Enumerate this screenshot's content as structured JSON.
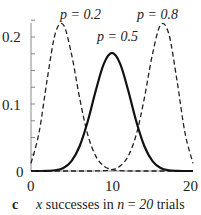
{
  "chart_data": {
    "type": "line",
    "title": "",
    "panel_label": "c",
    "xlabel": "x successes in n = 20 trials",
    "xlabel_parts": {
      "var": "x",
      "mid": " successes in ",
      "n": "n",
      "eq": " = ",
      "nval": "20",
      "end": "  trials"
    },
    "ylabel": "",
    "xlim": [
      0,
      20
    ],
    "ylim": [
      0,
      0.22
    ],
    "x_ticks": [
      "0",
      "10",
      "20"
    ],
    "y_ticks": [
      "0",
      "0.1",
      "0.2"
    ],
    "grid": false,
    "series": [
      {
        "name": "p = 0.2",
        "style": "dashed",
        "p": 0.2,
        "x": [
          0,
          1,
          2,
          3,
          4,
          5,
          6,
          7,
          8,
          9,
          10,
          11,
          12,
          13,
          14,
          15,
          16,
          17,
          18,
          19,
          20
        ],
        "values": [
          0.0115,
          0.0576,
          0.1369,
          0.2054,
          0.2182,
          0.1746,
          0.1091,
          0.0545,
          0.0222,
          0.0074,
          0.002,
          0.0005,
          0.0001,
          0,
          0,
          0,
          0,
          0,
          0,
          0,
          0
        ]
      },
      {
        "name": "p = 0.5",
        "style": "solid",
        "p": 0.5,
        "x": [
          0,
          1,
          2,
          3,
          4,
          5,
          6,
          7,
          8,
          9,
          10,
          11,
          12,
          13,
          14,
          15,
          16,
          17,
          18,
          19,
          20
        ],
        "values": [
          0,
          0,
          0.0002,
          0.0011,
          0.0046,
          0.0148,
          0.037,
          0.0739,
          0.1201,
          0.1602,
          0.1762,
          0.1602,
          0.1201,
          0.0739,
          0.037,
          0.0148,
          0.0046,
          0.0011,
          0.0002,
          0,
          0
        ]
      },
      {
        "name": "p = 0.8",
        "style": "dashed",
        "p": 0.8,
        "x": [
          0,
          1,
          2,
          3,
          4,
          5,
          6,
          7,
          8,
          9,
          10,
          11,
          12,
          13,
          14,
          15,
          16,
          17,
          18,
          19,
          20
        ],
        "values": [
          0,
          0,
          0,
          0,
          0,
          0,
          0,
          0,
          0.0001,
          0.0005,
          0.002,
          0.0074,
          0.0222,
          0.0545,
          0.1091,
          0.1746,
          0.2182,
          0.2054,
          0.1369,
          0.0576,
          0.0115
        ]
      }
    ],
    "annotations": [
      {
        "text": "p = 0.2"
      },
      {
        "text": "p = 0.5"
      },
      {
        "text": "p = 0.8"
      }
    ]
  }
}
